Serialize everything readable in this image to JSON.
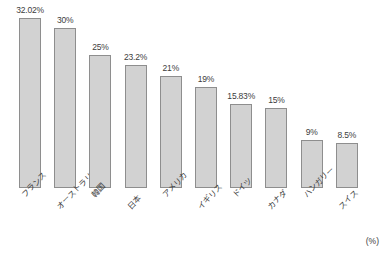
{
  "chart_data": {
    "type": "bar",
    "title": "",
    "subtitle": "",
    "xlabel": "",
    "ylabel": "",
    "unit_note": "(%)",
    "grid": false,
    "legend": false,
    "ylim": [
      0,
      33
    ],
    "categories": [
      "フランス",
      "オーストラリア",
      "韓国",
      "日本",
      "アメリカ",
      "イギリス",
      "ドイツ",
      "カナダ",
      "ハンガリー",
      "スイス"
    ],
    "values": [
      32.02,
      30,
      25,
      23.2,
      21,
      19,
      15.83,
      15,
      9,
      8.5
    ],
    "value_labels": [
      "32.02%",
      "30%",
      "25%",
      "23.2%",
      "21%",
      "19%",
      "15.83%",
      "15%",
      "9%",
      "8.5%"
    ],
    "bar_color": "#d2d2d2",
    "bar_border_color": "#8e8e8e",
    "background_color": "#ffffff",
    "text_color": "#3c3c3c"
  }
}
